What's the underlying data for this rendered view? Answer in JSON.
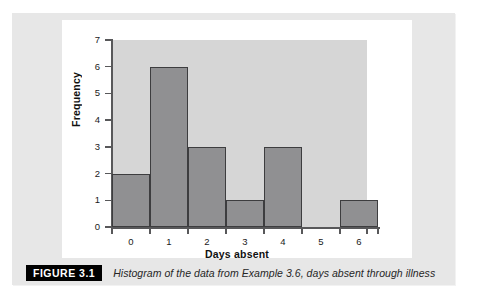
{
  "figure": {
    "badge_label": "FIGURE 3.1",
    "caption": "Histogram of the data from Example 3.6, days absent through illness"
  },
  "colors": {
    "panel_background": "#e7e7e7",
    "card_background": "#ffffff",
    "plot_background": "#d6d6d6",
    "bar_fill": "#909092",
    "bar_outline": "#3d3d3f",
    "axis": "#58585a",
    "badge_background": "#000000",
    "badge_text": "#ffffff"
  },
  "chart_data": {
    "type": "bar",
    "title": "",
    "subtitle": "",
    "xlabel": "Days absent",
    "ylabel": "Frequency",
    "categories": [
      "0",
      "1",
      "2",
      "3",
      "4",
      "5",
      "6"
    ],
    "values": [
      2,
      6,
      3,
      1,
      3,
      0,
      1
    ],
    "x_tick_labels": [
      "0",
      "1",
      "2",
      "3",
      "4",
      "5",
      "6"
    ],
    "y_tick_labels": [
      "0",
      "1",
      "2",
      "3",
      "4",
      "5",
      "6",
      "7"
    ],
    "y_ticks": [
      0,
      1,
      2,
      3,
      4,
      5,
      6,
      7
    ],
    "ylim": [
      0,
      7
    ],
    "xlim": [
      -0.5,
      6.5
    ],
    "bin_width": 1,
    "grid": false,
    "legend": false,
    "legend_position": "none",
    "annotations": []
  }
}
